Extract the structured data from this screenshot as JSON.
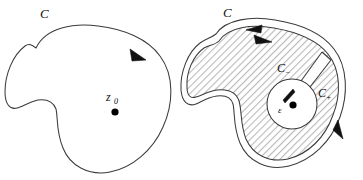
{
  "figure": {
    "background_color": "#ffffff",
    "stroke_color": "#333333",
    "hatch_color": "#bdbdbd",
    "point_color": "#000000",
    "panels": [
      {
        "id": "left",
        "name": "simple-closed-contour",
        "contour_label": "C",
        "point_label": "z",
        "point_subscript": "0",
        "orientation": "counterclockwise",
        "arrow_count": 1,
        "shaded": false
      },
      {
        "id": "right",
        "name": "deformed-contour-with-keyhole",
        "contour_label": "C",
        "inner_label_minus": "C",
        "inner_subscript_minus": "−",
        "inner_label_plus": "C",
        "inner_subscript_plus": "+",
        "radius_label": "ε",
        "orientation": "counterclockwise",
        "arrow_count": 3,
        "shaded": true,
        "hatch_pattern": "diagonal"
      }
    ]
  }
}
